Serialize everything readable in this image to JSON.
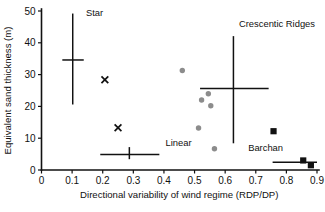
{
  "chart_data": {
    "type": "scatter",
    "title": "",
    "xlabel": "Directional variability of wind regime (RDP/DP)",
    "ylabel": "Equivalent sand thickness (m)",
    "xlim": [
      0,
      0.9
    ],
    "ylim": [
      0,
      50
    ],
    "xticks": [
      "0",
      "0.1",
      "0.2",
      "0.3",
      "0.4",
      "0.5",
      "0.6",
      "0.7",
      "0.8",
      "0.9"
    ],
    "xtick_values": [
      0,
      0.1,
      0.2,
      0.3,
      0.4,
      0.5,
      0.6,
      0.7,
      0.8,
      0.9
    ],
    "yticks": [
      "0",
      "10",
      "20",
      "30",
      "40",
      "50"
    ],
    "ytick_values": [
      0,
      10,
      20,
      30,
      40,
      50
    ],
    "grid": false,
    "legend_position": "inline-annotations",
    "annotations": [
      {
        "name": "star-label",
        "text": "Star",
        "x": 0.145,
        "y": 48.5
      },
      {
        "name": "linear-label",
        "text": "Linear",
        "x": 0.405,
        "y": 7.5
      },
      {
        "name": "crescentic-ridges-label",
        "text": "Crescentic Ridges",
        "x": 0.645,
        "y": 45.0
      },
      {
        "name": "barchan-label",
        "text": "Barchan",
        "x": 0.675,
        "y": 6.0
      }
    ],
    "series": [
      {
        "name": "Star",
        "marker": "cross-range",
        "color": "#111111",
        "mean_x": 0.102,
        "mean_y": 34.6,
        "x_range": [
          0.068,
          0.138
        ],
        "y_range": [
          20.6,
          49.2
        ]
      },
      {
        "name": "Linear",
        "marker": "cross-range",
        "color": "#111111",
        "mean_x": 0.287,
        "mean_y": 4.9,
        "x_range": [
          0.192,
          0.385
        ],
        "y_range": [
          3.4,
          7.2
        ]
      },
      {
        "name": "Crescentic Ridges",
        "marker": "cross-range",
        "color": "#111111",
        "mean_x": 0.627,
        "mean_y": 25.6,
        "x_range": [
          0.518,
          0.742
        ],
        "y_range": [
          8.4,
          42.1
        ]
      },
      {
        "name": "Barchan",
        "marker": "cross-range",
        "color": "#111111",
        "mean_x": 0.862,
        "mean_y": 2.4,
        "x_range": [
          0.755,
          0.9
        ],
        "y_range": [
          2.4,
          2.4
        ]
      },
      {
        "name": "Star sites",
        "marker": "x",
        "color": "#111111",
        "points": [
          {
            "x": 0.207,
            "y": 28.4
          },
          {
            "x": 0.25,
            "y": 13.3
          }
        ]
      },
      {
        "name": "Crescentic ridge sites",
        "marker": "circle",
        "color": "#8c8c8c",
        "points": [
          {
            "x": 0.46,
            "y": 31.3
          },
          {
            "x": 0.545,
            "y": 24.0
          },
          {
            "x": 0.523,
            "y": 22.0
          },
          {
            "x": 0.553,
            "y": 20.2
          },
          {
            "x": 0.513,
            "y": 13.2
          },
          {
            "x": 0.565,
            "y": 6.7
          }
        ]
      },
      {
        "name": "Barchan sites",
        "marker": "square",
        "color": "#111111",
        "points": [
          {
            "x": 0.758,
            "y": 12.2
          },
          {
            "x": 0.855,
            "y": 3.0
          },
          {
            "x": 0.88,
            "y": 1.5
          }
        ]
      }
    ]
  }
}
